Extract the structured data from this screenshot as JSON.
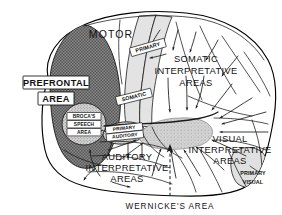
{
  "figure": {
    "background_color": "#ffffff",
    "ink_color": "#111111"
  },
  "regions": {
    "prefrontal": {
      "label_line1": "PREFRONTAL",
      "label_line2": "AREA",
      "fill_color": "#7d7d7d",
      "pattern": "dark-checker-hatch"
    },
    "motor": {
      "label": "MOTOR",
      "fill_color": "#ffffff"
    },
    "primary_motor": {
      "label": "PRIMARY",
      "fill_color": "#e3e3e3"
    },
    "somatic_primary": {
      "label": "SOMATIC",
      "fill_color": "#e3e3e3"
    },
    "brocas": {
      "label_line1": "BROCA'S",
      "label_line2": "SPEECH",
      "label_line3": "AREA",
      "fill_color": "#c9c9c9",
      "pattern": "stipple"
    },
    "primary_auditory": {
      "label_line1": "PRIMARY",
      "label_line2": "AUDITORY",
      "fill_color": "#d8d8d8",
      "pattern": "stipple"
    },
    "somatic_interpretative": {
      "label_line1": "SOMATIC",
      "label_line2": "INTERPRETATIVE",
      "label_line3": "AREAS",
      "fill_color": "#ffffff"
    },
    "auditory_interpretative": {
      "label_line1": "AUDITORY",
      "label_line2": "INTERPRETATIVE",
      "label_line3": "AREAS",
      "fill_color": "#ffffff"
    },
    "visual_interpretative": {
      "label_line1": "VISUAL",
      "label_line2": "INTERPRETATIVE",
      "label_line3": "AREAS",
      "fill_color": "#ffffff"
    },
    "primary_visual": {
      "label_line1": "PRIMARY",
      "label_line2": "VISUAL",
      "fill_color": "#e0e0e0"
    },
    "wernicke_blob": {
      "fill_color": "#d0d0d0",
      "pattern": "stipple"
    }
  },
  "caption": {
    "label": "WERNICKE'S AREA",
    "pointer": "dashed-line"
  }
}
